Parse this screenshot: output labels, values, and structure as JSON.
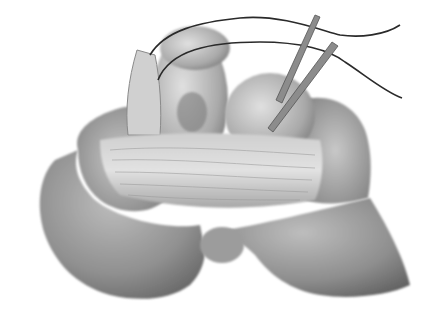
{
  "image": {
    "kind": "grayscale surgical illustration",
    "width": 428,
    "height": 319,
    "background": "#ffffff",
    "colors": {
      "skin_dark": "#6e6e6e",
      "skin_mid": "#9a9a9a",
      "skin_light": "#c4c4c4",
      "tissue_light": "#d8d8d8",
      "suture": "#2a2a2a",
      "instrument": "#8c8c8c"
    }
  }
}
